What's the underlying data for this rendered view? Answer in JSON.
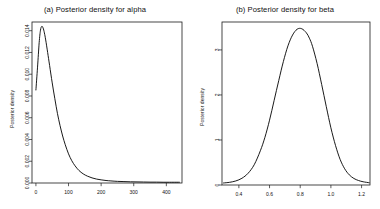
{
  "figure": {
    "background": "#ffffff",
    "line_color": "#000000",
    "panels": [
      {
        "id": "alpha",
        "title": "(a) Posterior density for alpha",
        "ylabel": "Posterior density"
      },
      {
        "id": "beta",
        "title": "(b) Posterior density for beta",
        "ylabel": "Posterior density"
      }
    ]
  },
  "chart_data": [
    {
      "type": "line",
      "id": "posterior-alpha",
      "title": "(a) Posterior density for alpha",
      "xlabel": "",
      "ylabel": "Posterior density",
      "xlim": [
        -12,
        448
      ],
      "ylim": [
        0,
        0.0148
      ],
      "grid": false,
      "legend": null,
      "xticks": [
        0,
        100,
        200,
        300,
        400
      ],
      "xtick_labels": [
        "0",
        "100",
        "200",
        "300",
        "400"
      ],
      "yticks": [
        0.0,
        0.002,
        0.004,
        0.006,
        0.008,
        0.01,
        0.012,
        0.014
      ],
      "ytick_labels": [
        "0.000",
        "0.002",
        "0.004",
        "0.006",
        "0.008",
        "0.010",
        "0.012",
        "0.014"
      ],
      "x": [
        0,
        5,
        10,
        14,
        18,
        22,
        26,
        30,
        36,
        42,
        50,
        58,
        66,
        74,
        82,
        90,
        100,
        110,
        120,
        132,
        145,
        158,
        172,
        186,
        200,
        215,
        230,
        250,
        270,
        290,
        310,
        330,
        350,
        370,
        390,
        410,
        430,
        440
      ],
      "y": [
        0.00855,
        0.01065,
        0.0129,
        0.01405,
        0.0144,
        0.01425,
        0.0138,
        0.01315,
        0.012,
        0.0108,
        0.0092,
        0.00775,
        0.0064,
        0.00528,
        0.00432,
        0.00352,
        0.00268,
        0.00205,
        0.00158,
        0.00115,
        0.00084,
        0.00063,
        0.00047,
        0.00036,
        0.00029,
        0.00023,
        0.00019,
        0.00015,
        0.00013,
        0.00011,
        0.0001,
        9e-05,
        8e-05,
        8e-05,
        7e-05,
        7e-05,
        7e-05,
        7e-05
      ]
    },
    {
      "type": "line",
      "id": "posterior-beta",
      "title": "(b) Posterior density for beta",
      "xlabel": "",
      "ylabel": "Posterior density",
      "xlim": [
        0.29,
        1.255
      ],
      "ylim": [
        0,
        3.62
      ],
      "grid": false,
      "legend": null,
      "xticks": [
        0.4,
        0.6,
        0.8,
        1.0,
        1.2
      ],
      "xtick_labels": [
        "0.4",
        "0.6",
        "0.8",
        "1.0",
        "1.2"
      ],
      "yticks": [
        0,
        1,
        2,
        3
      ],
      "ytick_labels": [
        "0",
        "1",
        "2",
        "3"
      ],
      "x": [
        0.3,
        0.34,
        0.38,
        0.42,
        0.46,
        0.5,
        0.54,
        0.57,
        0.6,
        0.63,
        0.66,
        0.69,
        0.72,
        0.75,
        0.78,
        0.81,
        0.84,
        0.86,
        0.88,
        0.91,
        0.94,
        0.97,
        1.0,
        1.03,
        1.06,
        1.09,
        1.12,
        1.15,
        1.18,
        1.21,
        1.25
      ],
      "y": [
        0.045,
        0.06,
        0.09,
        0.15,
        0.26,
        0.45,
        0.76,
        1.06,
        1.44,
        1.88,
        2.32,
        2.74,
        3.09,
        3.33,
        3.46,
        3.47,
        3.38,
        3.26,
        3.08,
        2.7,
        2.23,
        1.74,
        1.27,
        0.88,
        0.57,
        0.36,
        0.225,
        0.145,
        0.1,
        0.072,
        0.05
      ]
    }
  ]
}
